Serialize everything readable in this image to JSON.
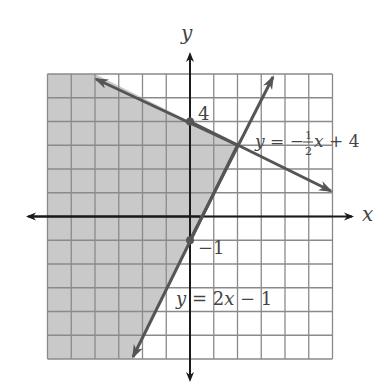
{
  "chart_data": {
    "type": "line",
    "title": "",
    "xlabel": "x",
    "ylabel": "y",
    "xlim": [
      -6,
      6
    ],
    "ylim": [
      -6,
      6
    ],
    "grid": true,
    "grid_step": 1,
    "series": [
      {
        "name": "y = −½x + 4",
        "slope": -0.5,
        "intercept": 4,
        "points": [
          [
            -4,
            6
          ],
          [
            6,
            1
          ]
        ],
        "marked_point": [
          0,
          4
        ],
        "marked_label": "4",
        "arrows": "both"
      },
      {
        "name": "y = 2x − 1",
        "slope": 2,
        "intercept": -1,
        "points": [
          [
            -2.5,
            -6
          ],
          [
            3.5,
            6
          ]
        ],
        "marked_point": [
          0,
          -1
        ],
        "marked_label": "−1",
        "arrows": "both"
      }
    ],
    "shaded_region": {
      "description": "y ≤ −½x + 4 and y ≥ 2x − 1 (left of 2x−1, below −½x+4)",
      "polygon": [
        [
          -6,
          6
        ],
        [
          -4,
          6
        ],
        [
          2,
          3
        ],
        [
          -2.5,
          -6
        ],
        [
          -6,
          -6
        ]
      ]
    },
    "intersection": [
      2,
      3
    ]
  },
  "labels": {
    "x_axis": "x",
    "y_axis": "y",
    "y_intercept_1": "4",
    "y_intercept_2": "−1",
    "eq1_prefix": "y = −",
    "eq1_num": "1",
    "eq1_den": "2",
    "eq1_suffix": "x + 4",
    "eq2": "y = 2x − 1"
  },
  "colors": {
    "shade": "#c9c9c9",
    "grid": "#8a8a8a",
    "line": "#555555",
    "axis": "#1a1a1a"
  }
}
